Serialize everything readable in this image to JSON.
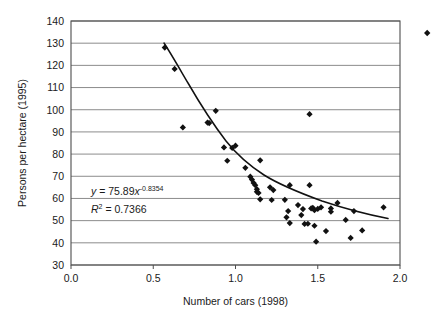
{
  "chart_data": {
    "type": "scatter",
    "title": "",
    "xlabel": "Number of cars (1998)",
    "ylabel": "Persons per hectare (1995)",
    "xlim": [
      0.0,
      2.0
    ],
    "ylim": [
      30,
      140
    ],
    "xticks": [
      "0.0",
      "0.5",
      "1.0",
      "1.5",
      "2.0"
    ],
    "xtick_values": [
      0.0,
      0.5,
      1.0,
      1.5,
      2.0
    ],
    "yticks": [
      "30",
      "40",
      "50",
      "60",
      "70",
      "80",
      "90",
      "100",
      "110",
      "120",
      "130",
      "140"
    ],
    "ytick_values": [
      30,
      40,
      50,
      60,
      70,
      80,
      90,
      100,
      110,
      120,
      130,
      140
    ],
    "grid": "horizontal",
    "legend": "none",
    "marker_shape": "diamond",
    "marker_color": "#111111",
    "trendline_color": "#111111",
    "annotations": [
      {
        "name": "regression-equation",
        "text": "y = 75.89x",
        "exponent": "-0.8354"
      },
      {
        "name": "r-squared",
        "text": "R",
        "superscript": "2",
        "rest": " = 0.7366"
      }
    ],
    "equation_full": "y = 75.89x^-0.8354",
    "r_squared_full": "R^2 = 0.7366",
    "fit_coefficient": 75.89,
    "fit_exponent": -0.8354,
    "r_squared": 0.7366,
    "points": [
      [
        0.57,
        128.0
      ],
      [
        0.63,
        118.4
      ],
      [
        0.68,
        92.0
      ],
      [
        0.83,
        94.2
      ],
      [
        0.84,
        94.0
      ],
      [
        0.88,
        99.5
      ],
      [
        0.93,
        83.0
      ],
      [
        0.95,
        77.0
      ],
      [
        0.98,
        82.8
      ],
      [
        1.0,
        83.8
      ],
      [
        1.06,
        73.8
      ],
      [
        1.09,
        69.8
      ],
      [
        1.1,
        68.5
      ],
      [
        1.11,
        67.0
      ],
      [
        1.12,
        66.0
      ],
      [
        1.13,
        64.2
      ],
      [
        1.13,
        63.0
      ],
      [
        1.14,
        62.5
      ],
      [
        1.15,
        77.2
      ],
      [
        1.15,
        59.6
      ],
      [
        1.21,
        65.0
      ],
      [
        1.22,
        59.3
      ],
      [
        1.23,
        63.8
      ],
      [
        1.3,
        59.4
      ],
      [
        1.31,
        51.5
      ],
      [
        1.32,
        54.3
      ],
      [
        1.33,
        66.0
      ],
      [
        1.33,
        48.9
      ],
      [
        1.38,
        57.0
      ],
      [
        1.4,
        52.5
      ],
      [
        1.41,
        55.2
      ],
      [
        1.42,
        48.5
      ],
      [
        1.44,
        48.6
      ],
      [
        1.45,
        98.0
      ],
      [
        1.45,
        66.0
      ],
      [
        1.46,
        55.5
      ],
      [
        1.47,
        55.8
      ],
      [
        1.48,
        54.7
      ],
      [
        1.48,
        47.7
      ],
      [
        1.49,
        40.5
      ],
      [
        1.5,
        55.3
      ],
      [
        1.52,
        56.0
      ],
      [
        1.55,
        45.3
      ],
      [
        1.58,
        55.5
      ],
      [
        1.58,
        54.0
      ],
      [
        1.62,
        58.0
      ],
      [
        1.67,
        50.3
      ],
      [
        1.7,
        42.2
      ],
      [
        1.72,
        54.3
      ],
      [
        1.77,
        45.6
      ],
      [
        1.9,
        56.0
      ]
    ]
  }
}
